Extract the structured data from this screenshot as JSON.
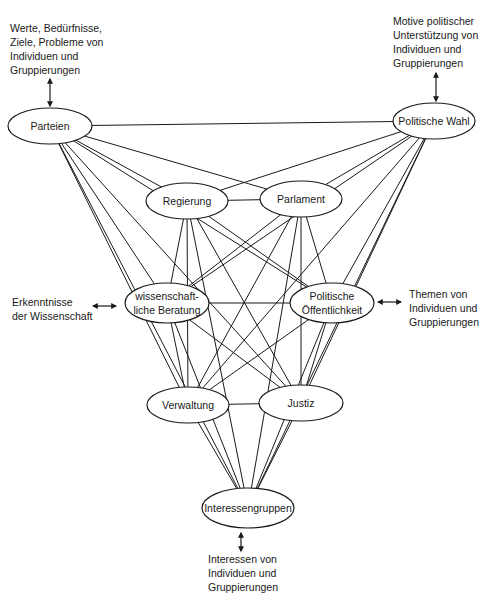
{
  "diagram": {
    "type": "network",
    "nodes": [
      {
        "id": "parteien",
        "label": [
          "Parteien"
        ],
        "cx": 50,
        "cy": 126,
        "rx": 42,
        "ry": 18
      },
      {
        "id": "politische-wahl",
        "label": [
          "Politische Wahl"
        ],
        "cx": 434,
        "cy": 121,
        "rx": 41,
        "ry": 18
      },
      {
        "id": "regierung",
        "label": [
          "Regierung"
        ],
        "cx": 187,
        "cy": 201,
        "rx": 41,
        "ry": 18
      },
      {
        "id": "parlament",
        "label": [
          "Parlament"
        ],
        "cx": 301,
        "cy": 199,
        "rx": 41,
        "ry": 18
      },
      {
        "id": "wissenschaftliche-beratung",
        "label": [
          "wissenschaft-",
          "liche Beratung"
        ],
        "cx": 167,
        "cy": 303,
        "rx": 42,
        "ry": 20
      },
      {
        "id": "politische-oeffentlichkeit",
        "label": [
          "Politische",
          "Öffentlichkeit"
        ],
        "cx": 332,
        "cy": 303,
        "rx": 42,
        "ry": 20
      },
      {
        "id": "verwaltung",
        "label": [
          "Verwaltung"
        ],
        "cx": 188,
        "cy": 405,
        "rx": 41,
        "ry": 18
      },
      {
        "id": "justiz",
        "label": [
          "Justiz"
        ],
        "cx": 301,
        "cy": 403,
        "rx": 42,
        "ry": 18
      },
      {
        "id": "interessengruppen",
        "label": [
          "Interessengruppen"
        ],
        "cx": 248,
        "cy": 508,
        "rx": 46,
        "ry": 20
      }
    ],
    "edges": [
      [
        "parteien",
        "politische-wahl"
      ],
      [
        "parteien",
        "regierung"
      ],
      [
        "parteien",
        "parlament"
      ],
      [
        "parteien",
        "wissenschaftliche-beratung"
      ],
      [
        "parteien",
        "politische-oeffentlichkeit"
      ],
      [
        "parteien",
        "verwaltung"
      ],
      [
        "parteien",
        "justiz"
      ],
      [
        "parteien",
        "interessengruppen"
      ],
      [
        "politische-wahl",
        "regierung"
      ],
      [
        "politische-wahl",
        "parlament"
      ],
      [
        "politische-wahl",
        "wissenschaftliche-beratung"
      ],
      [
        "politische-wahl",
        "politische-oeffentlichkeit"
      ],
      [
        "politische-wahl",
        "verwaltung"
      ],
      [
        "politische-wahl",
        "justiz"
      ],
      [
        "politische-wahl",
        "interessengruppen"
      ],
      [
        "regierung",
        "parlament"
      ],
      [
        "regierung",
        "wissenschaftliche-beratung"
      ],
      [
        "regierung",
        "politische-oeffentlichkeit"
      ],
      [
        "regierung",
        "verwaltung"
      ],
      [
        "regierung",
        "justiz"
      ],
      [
        "regierung",
        "interessengruppen"
      ],
      [
        "parlament",
        "wissenschaftliche-beratung"
      ],
      [
        "parlament",
        "politische-oeffentlichkeit"
      ],
      [
        "parlament",
        "verwaltung"
      ],
      [
        "parlament",
        "justiz"
      ],
      [
        "parlament",
        "interessengruppen"
      ],
      [
        "wissenschaftliche-beratung",
        "politische-oeffentlichkeit"
      ],
      [
        "wissenschaftliche-beratung",
        "verwaltung"
      ],
      [
        "wissenschaftliche-beratung",
        "justiz"
      ],
      [
        "wissenschaftliche-beratung",
        "interessengruppen"
      ],
      [
        "politische-oeffentlichkeit",
        "verwaltung"
      ],
      [
        "politische-oeffentlichkeit",
        "justiz"
      ],
      [
        "politische-oeffentlichkeit",
        "interessengruppen"
      ],
      [
        "verwaltung",
        "justiz"
      ],
      [
        "verwaltung",
        "interessengruppen"
      ],
      [
        "justiz",
        "interessengruppen"
      ]
    ],
    "external_inputs": [
      {
        "id": "werte",
        "lines": [
          "Werte, Bedürfnisse,",
          "Ziele, Probleme von",
          "Individuen und",
          "Gruppierungen"
        ],
        "target": "parteien",
        "x": 10,
        "y": 21
      },
      {
        "id": "motive",
        "lines": [
          "Motive politischer",
          "Unterstützung von",
          "Individuen und",
          "Gruppierungen"
        ],
        "target": "politische-wahl",
        "x": 393,
        "y": 14
      },
      {
        "id": "erkenntnisse",
        "lines": [
          "Erkenntnisse",
          "der Wissenschaft"
        ],
        "target": "wissenschaftliche-beratung",
        "x": 12,
        "y": 295
      },
      {
        "id": "themen",
        "lines": [
          "Themen von",
          "Individuen und",
          "Gruppierungen"
        ],
        "target": "politische-oeffentlichkeit",
        "x": 409,
        "y": 287
      },
      {
        "id": "interessen",
        "lines": [
          "Interessen von",
          "Individuen und",
          "Gruppierungen"
        ],
        "target": "interessengruppen",
        "x": 208,
        "y": 552
      }
    ],
    "arrows": [
      {
        "x1": 50,
        "y1": 79,
        "x2": 50,
        "y2": 106
      },
      {
        "x1": 436,
        "y1": 73,
        "x2": 436,
        "y2": 101
      },
      {
        "x1": 93,
        "y1": 306,
        "x2": 116,
        "y2": 306
      },
      {
        "x1": 378,
        "y1": 302,
        "x2": 401,
        "y2": 302
      },
      {
        "x1": 241,
        "y1": 533,
        "x2": 241,
        "y2": 551
      }
    ],
    "line_color": "#1a1a1a"
  }
}
